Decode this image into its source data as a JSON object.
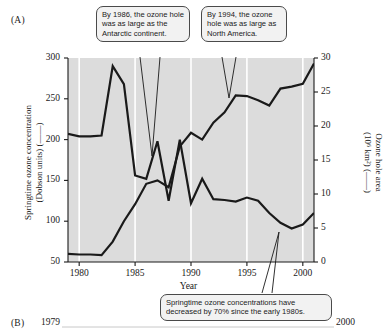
{
  "figure": {
    "panel_a_label": "(A)",
    "panel_b_label": "(B)",
    "panel_b_year_start": "1979",
    "panel_b_year_end": "2000"
  },
  "axes": {
    "y_left_title_line1": "Springtime ozone concentration",
    "y_left_title_line2": "(Dobson units) (——)",
    "y_right_title_line1": "Ozone hole area",
    "y_right_title_line2": "(10⁶ km²) (——)",
    "x_title": "Year",
    "y_left_ticks": [
      "300",
      "250",
      "200",
      "150",
      "100",
      "50"
    ],
    "y_right_ticks": [
      "30",
      "25",
      "20",
      "15",
      "10",
      "5",
      "0"
    ],
    "x_ticks": [
      "1980",
      "1985",
      "1990",
      "1995",
      "2000"
    ],
    "y_left_range": [
      50,
      300
    ],
    "y_right_range": [
      0,
      30
    ],
    "x_range": [
      1979,
      2001
    ]
  },
  "callouts": [
    {
      "id": "callout-1986",
      "text": "By 1986, the ozone hole was as large as the Antarctic continent."
    },
    {
      "id": "callout-1994",
      "text": "By 1994, the ozone hole was as large as North America."
    },
    {
      "id": "callout-decline",
      "text": "Springtime ozone concentrations have decreased by 70% since the early 1980s."
    }
  ],
  "colors": {
    "plot_background": "#dcdcdc",
    "gridline": "#ffffff",
    "line": "#1a1a1a",
    "callout_fill": "#f2f2f2",
    "callout_border": "#4a4a4a",
    "page_background": "#ffffff"
  },
  "chart_data": {
    "type": "line",
    "title": "",
    "xlabel": "Year",
    "ylabel": "Springtime ozone concentration (Dobson units)",
    "y2label": "Ozone hole area (10⁶ km²)",
    "xlim": [
      1979,
      2001
    ],
    "ylim": [
      50,
      300
    ],
    "y2lim": [
      0,
      30
    ],
    "grid": "vertical-only",
    "legend": "inline-axis-labels",
    "x": [
      1979,
      1980,
      1981,
      1982,
      1983,
      1984,
      1985,
      1986,
      1987,
      1988,
      1989,
      1990,
      1991,
      1992,
      1993,
      1994,
      1995,
      1996,
      1997,
      1998,
      1999,
      2000,
      2001
    ],
    "series": [
      {
        "name": "Springtime ozone concentration (Dobson units)",
        "axis": "left",
        "values": [
          207,
          204,
          204,
          205,
          290,
          268,
          156,
          152,
          198,
          125,
          200,
          122,
          152,
          127,
          126,
          124,
          129,
          125,
          110,
          98,
          91,
          96,
          110
        ]
      },
      {
        "name": "Ozone hole area (10⁶ km²)",
        "axis": "right",
        "values": [
          1.2,
          1.1,
          1.1,
          1.0,
          3.0,
          6.0,
          8.5,
          11.5,
          12.0,
          11.0,
          17.0,
          19.0,
          18.0,
          20.5,
          22.0,
          24.5,
          24.4,
          23.8,
          23.0,
          25.5,
          25.8,
          26.2,
          29.2
        ]
      }
    ],
    "annotations": [
      {
        "text": "By 1986, the ozone hole was as large as the Antarctic continent.",
        "points_to_year": 1986
      },
      {
        "text": "By 1994, the ozone hole was as large as North America.",
        "points_to_year": 1994
      },
      {
        "text": "Springtime ozone concentrations have decreased by 70% since the early 1980s.",
        "points_to_year": 1998
      }
    ]
  }
}
